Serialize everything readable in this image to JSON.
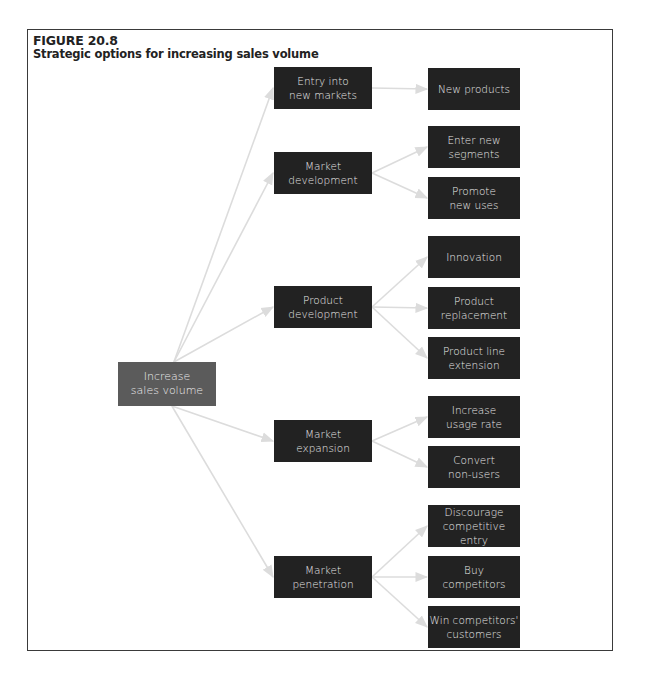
{
  "figure": {
    "number": "FIGURE 20.8",
    "title": "Strategic options for increasing sales volume"
  },
  "colors": {
    "node_fill": "#222222",
    "root_fill": "#5b5b5b",
    "node_text": "#e6e6e6",
    "edge": "#dcdcdc",
    "frame": "#3a3a3a"
  },
  "diagram": {
    "root": {
      "id": "root",
      "label": "Increase\nsales volume",
      "x": 118,
      "y": 362,
      "w": 98,
      "h": 44
    },
    "strategies": [
      {
        "id": "s0",
        "label": "Entry into\nnew markets",
        "x": 274,
        "y": 67,
        "w": 98,
        "h": 42
      },
      {
        "id": "s1",
        "label": "Market\ndevelopment",
        "x": 274,
        "y": 152,
        "w": 98,
        "h": 42
      },
      {
        "id": "s2",
        "label": "Product\ndevelopment",
        "x": 274,
        "y": 286,
        "w": 98,
        "h": 42
      },
      {
        "id": "s3",
        "label": "Market\nexpansion",
        "x": 274,
        "y": 420,
        "w": 98,
        "h": 42
      },
      {
        "id": "s4",
        "label": "Market\npenetration",
        "x": 274,
        "y": 556,
        "w": 98,
        "h": 42
      }
    ],
    "options": [
      {
        "id": "o0",
        "parent": "s0",
        "label": "New products",
        "x": 428,
        "y": 68,
        "w": 92,
        "h": 42
      },
      {
        "id": "o1",
        "parent": "s1",
        "label": "Enter new\nsegments",
        "x": 428,
        "y": 126,
        "w": 92,
        "h": 42
      },
      {
        "id": "o2",
        "parent": "s1",
        "label": "Promote\nnew uses",
        "x": 428,
        "y": 177,
        "w": 92,
        "h": 42
      },
      {
        "id": "o3",
        "parent": "s2",
        "label": "Innovation",
        "x": 428,
        "y": 236,
        "w": 92,
        "h": 42
      },
      {
        "id": "o4",
        "parent": "s2",
        "label": "Product\nreplacement",
        "x": 428,
        "y": 287,
        "w": 92,
        "h": 42
      },
      {
        "id": "o5",
        "parent": "s2",
        "label": "Product line\nextension",
        "x": 428,
        "y": 337,
        "w": 92,
        "h": 42
      },
      {
        "id": "o6",
        "parent": "s3",
        "label": "Increase\nusage rate",
        "x": 428,
        "y": 396,
        "w": 92,
        "h": 42
      },
      {
        "id": "o7",
        "parent": "s3",
        "label": "Convert\nnon-users",
        "x": 428,
        "y": 446,
        "w": 92,
        "h": 42
      },
      {
        "id": "o8",
        "parent": "s4",
        "label": "Discourage\ncompetitive entry",
        "x": 428,
        "y": 505,
        "w": 92,
        "h": 42
      },
      {
        "id": "o9",
        "parent": "s4",
        "label": "Buy\ncompetitors",
        "x": 428,
        "y": 556,
        "w": 92,
        "h": 42
      },
      {
        "id": "o10",
        "parent": "s4",
        "label": "Win competitors'\ncustomers",
        "x": 428,
        "y": 606,
        "w": 92,
        "h": 42
      }
    ]
  }
}
